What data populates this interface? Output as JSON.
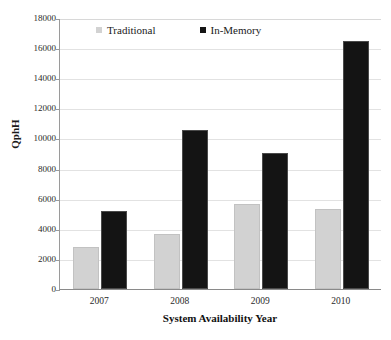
{
  "chart_data": {
    "type": "bar",
    "title": "",
    "subtitle": "",
    "xlabel": "System Availability Year",
    "ylabel": "QphH",
    "categories": [
      "2007",
      "2008",
      "2009",
      "2010"
    ],
    "series": [
      {
        "name": "Traditional",
        "color": "#d2d2d2",
        "values": [
          2790,
          3650,
          5650,
          5310
        ]
      },
      {
        "name": "In-Memory",
        "color": "#141414",
        "values": [
          5180,
          10560,
          9030,
          16470
        ]
      }
    ],
    "ylim": [
      0,
      18000
    ],
    "ytick_interval": 2000,
    "ytick_labels": [
      "0",
      "2000",
      "4000",
      "6000",
      "8000",
      "10000",
      "12000",
      "14000",
      "16000",
      "18000"
    ],
    "ytick_values": [
      0,
      2000,
      4000,
      6000,
      8000,
      10000,
      12000,
      14000,
      16000,
      18000
    ],
    "grid": true,
    "grid_axis": "y",
    "legend_position": "top-inside",
    "legend": [
      "Traditional",
      "In-Memory"
    ],
    "annotations": []
  },
  "legend": {
    "entries": [
      {
        "label": "Traditional",
        "swatch": "legend-swatch-traditional"
      },
      {
        "label": "In-Memory",
        "swatch": "legend-swatch-inmemory"
      }
    ]
  },
  "axes": {
    "y_title": "QphH",
    "x_title": "System Availability Year"
  }
}
